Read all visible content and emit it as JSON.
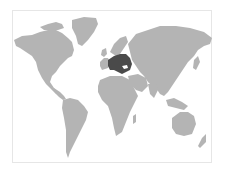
{
  "map": {
    "type": "world-locator-map",
    "land_color": "#b4b4b4",
    "highlight_color": "#4a4a4a",
    "frame_color": "#e6e6e6",
    "background_color": "#ffffff",
    "highlighted_region": "Central & Eastern Europe / Black Sea region",
    "regions": [
      {
        "name": "north-america",
        "highlighted": false
      },
      {
        "name": "greenland",
        "highlighted": false
      },
      {
        "name": "south-america",
        "highlighted": false
      },
      {
        "name": "europe-west",
        "highlighted": false
      },
      {
        "name": "scandinavia",
        "highlighted": false
      },
      {
        "name": "central-eastern-europe",
        "highlighted": true
      },
      {
        "name": "africa",
        "highlighted": false
      },
      {
        "name": "middle-east",
        "highlighted": false
      },
      {
        "name": "asia",
        "highlighted": false
      },
      {
        "name": "southeast-asia",
        "highlighted": false
      },
      {
        "name": "australia",
        "highlighted": false
      },
      {
        "name": "new-zealand",
        "highlighted": false
      }
    ]
  }
}
